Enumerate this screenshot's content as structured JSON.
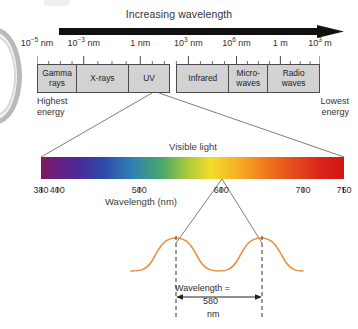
{
  "figure": {
    "title_arrow": "Increasing wavelength"
  },
  "em_scale": {
    "ticks": [
      {
        "label": "10−5 nm",
        "base": "10",
        "exp": "−5",
        "unit": "nm",
        "pos_pct": 0
      },
      {
        "label": "10−3 nm",
        "base": "10",
        "exp": "−3",
        "unit": "nm",
        "pos_pct": 16.5
      },
      {
        "label": "1 nm",
        "base": "1",
        "exp": "",
        "unit": "nm",
        "pos_pct": 36.5
      },
      {
        "label": "10³ nm",
        "base": "10",
        "exp": "3",
        "unit": "nm",
        "pos_pct": 53.5
      },
      {
        "label": "10⁶ nm",
        "base": "10",
        "exp": "6",
        "unit": "nm",
        "pos_pct": 70.5
      },
      {
        "label": "1 m",
        "base": "1",
        "exp": "",
        "unit": "m",
        "pos_pct": 86
      },
      {
        "label": "10³ m",
        "base": "10",
        "exp": "3",
        "unit": "m",
        "pos_pct": 100
      }
    ],
    "bands": [
      {
        "name": "gamma-rays",
        "line1": "Gamma",
        "line2": "rays",
        "flex": 15
      },
      {
        "name": "x-rays",
        "line1": "X-rays",
        "line2": "",
        "flex": 20
      },
      {
        "name": "ultraviolet",
        "line1": "UV",
        "line2": "",
        "flex": 16
      },
      {
        "name": "visible-notch",
        "line1": "",
        "line2": "",
        "flex": 0
      },
      {
        "name": "infrared",
        "line1": "Infrared",
        "line2": "",
        "flex": 20
      },
      {
        "name": "microwaves",
        "line1": "Micro-",
        "line2": "waves",
        "flex": 15
      },
      {
        "name": "radio-waves",
        "line1": "Radio",
        "line2": "waves",
        "flex": 20
      }
    ],
    "energy_left_line1": "Highest",
    "energy_left_line2": "energy",
    "energy_right_line1": "Lowest",
    "energy_right_line2": "energy"
  },
  "visible": {
    "caption": "Visible light",
    "axis_title": "Wavelength (nm)",
    "range_nm": [
      380,
      750
    ],
    "tick_labels": [
      "380",
      "400",
      "500",
      "600",
      "700",
      "750"
    ],
    "tick_values": [
      380,
      400,
      500,
      600,
      700,
      750
    ]
  },
  "wave": {
    "annot_label": "Wavelength =",
    "annot_value": "580",
    "annot_unit": "nm",
    "color": "#e8903c"
  },
  "colors": {
    "band_fill": "#d2d2d2",
    "band_stroke": "#4b4b4b",
    "text": "#333333",
    "wave": "#e8903c",
    "leader_line": "#6e6e6e"
  },
  "chart_data": {
    "type": "bar",
    "xlabel": "Wavelength (nm)",
    "ylabel": "",
    "categories": [
      "Gamma rays",
      "X-rays",
      "UV",
      "Visible light",
      "Infrared",
      "Micro-waves",
      "Radio waves"
    ],
    "values": [
      15,
      20,
      16,
      1,
      20,
      15,
      20
    ],
    "annotations": [
      "Increasing wavelength",
      "Highest energy",
      "Lowest energy",
      "Visible light",
      "Wavelength = 580 nm"
    ],
    "axis_ticks": [
      "10−5 nm",
      "10−3 nm",
      "1 nm",
      "10³ nm",
      "10⁶ nm",
      "1 m",
      "10³ m"
    ],
    "visible_ticks": [
      380,
      400,
      500,
      600,
      700,
      750
    ],
    "grid": false,
    "legend": "none"
  }
}
